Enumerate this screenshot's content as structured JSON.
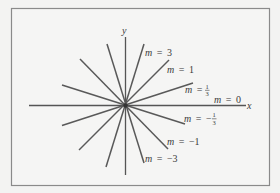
{
  "figure": {
    "axes": {
      "x_label": "x",
      "y_label": "y"
    },
    "lines": [
      {
        "slope": "3",
        "label_var": "m",
        "label_eq": "=",
        "label_val": "3"
      },
      {
        "slope": "1",
        "label_var": "m",
        "label_eq": "=",
        "label_val": "1"
      },
      {
        "slope": "1/3",
        "label_var": "m",
        "label_eq": "=",
        "label_num": "1",
        "label_den": "3",
        "label_sign": ""
      },
      {
        "slope": "0",
        "label_var": "m",
        "label_eq": "=",
        "label_val": "0"
      },
      {
        "slope": "-1/3",
        "label_var": "m",
        "label_eq": "=",
        "label_num": "1",
        "label_den": "3",
        "label_sign": "−"
      },
      {
        "slope": "-1",
        "label_var": "m",
        "label_eq": "=",
        "label_val": "−1"
      },
      {
        "slope": "-3",
        "label_var": "m",
        "label_eq": "=",
        "label_val": "−3"
      }
    ],
    "colors": {
      "background": "#f3f3f2",
      "frame": "#8a8a8a",
      "lines": "#595959",
      "text": "#3a3a3a"
    }
  }
}
